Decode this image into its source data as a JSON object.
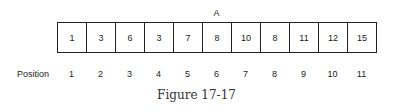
{
  "diagram": {
    "marker": {
      "label": "A",
      "position": 6
    },
    "array_values": [
      "1",
      "3",
      "6",
      "3",
      "7",
      "8",
      "10",
      "8",
      "11",
      "12",
      "15"
    ],
    "position_label": "Position",
    "positions": [
      "1",
      "2",
      "3",
      "4",
      "5",
      "6",
      "7",
      "8",
      "9",
      "10",
      "11"
    ],
    "caption": "Figure 17-17"
  }
}
